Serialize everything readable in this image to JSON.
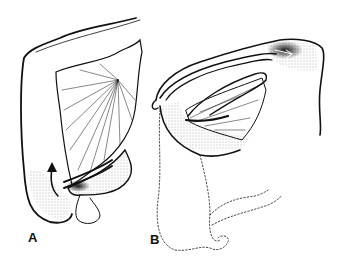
{
  "figure": {
    "panels": [
      {
        "id": "A",
        "label": "A",
        "description": "bowel loop with mesentery fan and upward curved arrow"
      },
      {
        "id": "B",
        "label": "B",
        "description": "folded bowel loop with mesentery, dotted outline of lower loops"
      }
    ],
    "colors": {
      "ink": "#111111",
      "background": "#ffffff",
      "stipple": "#555555"
    }
  }
}
